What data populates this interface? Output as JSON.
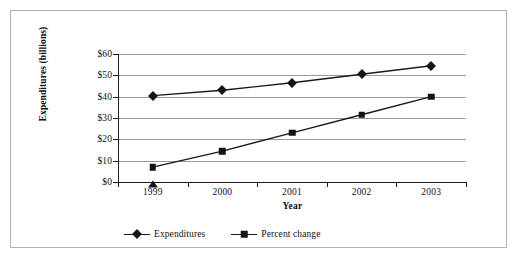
{
  "chart_data": {
    "type": "line",
    "title": "",
    "xlabel": "Year",
    "ylabel": "Expenditures (billions)",
    "categories": [
      "1999",
      "2000",
      "2001",
      "2002",
      "2003"
    ],
    "ylim": [
      0,
      60
    ],
    "yticks": [
      "$0",
      "$10",
      "$20",
      "$30",
      "$40",
      "$50",
      "$60"
    ],
    "ytick_values": [
      0,
      10,
      20,
      30,
      40,
      50,
      60
    ],
    "grid": "horizontal",
    "legend_position": "bottom-left",
    "series": [
      {
        "name": "Expenditures",
        "marker": "diamond",
        "values": [
          40.5,
          43,
          46.5,
          50.5,
          54.5
        ]
      },
      {
        "name": "Percent change",
        "marker": "square",
        "values": [
          7,
          14.5,
          23,
          31.5,
          40
        ]
      }
    ],
    "annotations": [
      {
        "marker": "triangle",
        "category": "1999",
        "value": 0
      }
    ]
  },
  "colors": {
    "series_line": "#1a1a1a",
    "marker": "#141414",
    "gridline": "#9a9a9a",
    "axis": "#1a1a1a",
    "border": "#b0b0b0",
    "background": "#ffffff"
  }
}
